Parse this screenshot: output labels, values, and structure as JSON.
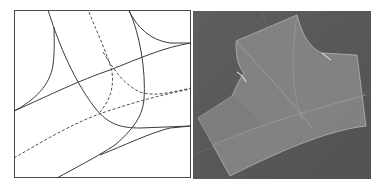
{
  "figure": {
    "panels": [
      {
        "id": "left",
        "type": "line-diagram",
        "description": "Parameter-domain curve network with solid and dashed curves",
        "background": "#ffffff",
        "stroke": "#3a3a3a",
        "box": {
          "x": 14,
          "y": 10,
          "w": 177,
          "h": 168
        }
      },
      {
        "id": "right",
        "type": "3d-rendering",
        "description": "Rendered translucent surface patches joined at a branching junction",
        "background": "#5a5a5a",
        "surface_color": "#8c8c8c",
        "box": {
          "x": 193,
          "y": 11,
          "w": 178,
          "h": 168
        }
      }
    ]
  }
}
